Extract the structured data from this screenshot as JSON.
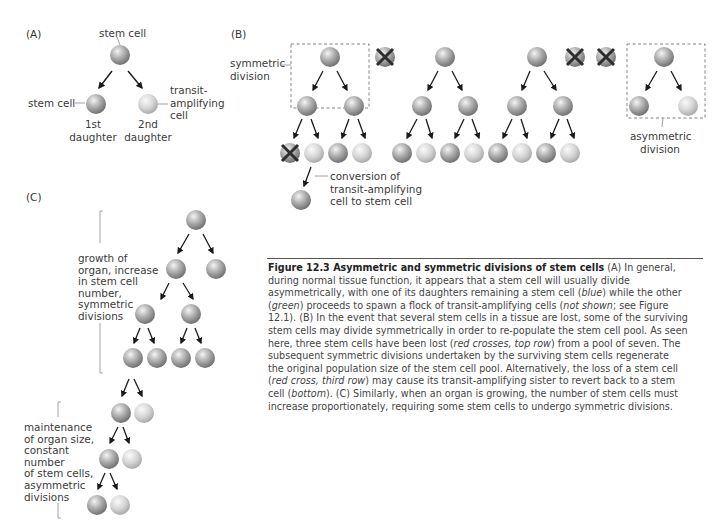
{
  "header_fragment": "g ... stem cell ... p ... g",
  "panels": {
    "A": {
      "label": "(A)",
      "top_cell_label": "stem cell",
      "left_child_label": "stem cell",
      "right_child_label_lines": [
        "transit-",
        "amplifying",
        "cell"
      ],
      "left_daughter_lines": [
        "1st",
        "daughter"
      ],
      "right_daughter_lines": [
        "2nd",
        "daughter"
      ]
    },
    "B": {
      "label": "(B)",
      "symmetric_label_lines": [
        "symmetric",
        "division"
      ],
      "asymmetric_label_lines": [
        "asymmetric",
        "division"
      ],
      "conversion_label_lines": [
        "conversion of",
        "transit-amplifying",
        "cell to stem cell"
      ]
    },
    "C": {
      "label": "(C)",
      "growth_label_lines": [
        "growth of",
        "organ, increase",
        "in stem cell",
        "number,",
        "symmetric",
        "divisions"
      ],
      "maintenance_label_lines": [
        "maintenance",
        "of organ size,",
        "constant",
        "number",
        "of stem cells,",
        "asymmetric",
        "divisions"
      ]
    }
  },
  "caption": {
    "title": "Figure 12.3 Asymmetric and symmetric divisions of stem cells",
    "lines": [
      [
        [
          "b",
          "Figure 12.3 Asymmetric and symmetric divisions of stem cells"
        ],
        [
          "t",
          " (A) In general,"
        ]
      ],
      [
        [
          "t",
          "during normal tissue function, it appears that a stem cell will usually divide"
        ]
      ],
      [
        [
          "t",
          "asymmetrically, with one of its daughters remaining a stem cell ("
        ],
        [
          "i",
          "blue"
        ],
        [
          "t",
          ") while the other"
        ]
      ],
      [
        [
          "t",
          "("
        ],
        [
          "i",
          "green"
        ],
        [
          "t",
          ") proceeds to spawn a flock of transit-amplifying cells ("
        ],
        [
          "i",
          "not shown"
        ],
        [
          "t",
          "; see Figure"
        ]
      ],
      [
        [
          "t",
          "12.1). (B) In the event that several stem cells in a tissue are lost, some of the surviving"
        ]
      ],
      [
        [
          "t",
          "stem cells may divide symmetrically in order to re-populate the stem cell pool. As seen"
        ]
      ],
      [
        [
          "t",
          "here, three stem cells have been lost ("
        ],
        [
          "i",
          "red crosses, top row"
        ],
        [
          "t",
          ") from a pool of seven. The"
        ]
      ],
      [
        [
          "t",
          "subsequent symmetric divisions undertaken by the surviving stem cells regenerate"
        ]
      ],
      [
        [
          "t",
          "the original population size of the stem cell pool. Alternatively, the loss of a stem cell"
        ]
      ],
      [
        [
          "t",
          "("
        ],
        [
          "i",
          "red cross, third row"
        ],
        [
          "t",
          ") may cause its transit-amplifying sister to revert back to a stem"
        ]
      ],
      [
        [
          "t",
          "cell ("
        ],
        [
          "i",
          "bottom"
        ],
        [
          "t",
          "). (C) Similarly, when an organ is growing, the number of stem cells must"
        ]
      ],
      [
        [
          "t",
          "increase proportionately, requiring some stem cells to undergo symmetric divisions."
        ]
      ]
    ]
  },
  "colors": {
    "stem_cell": "#8f8f8f",
    "transit_cell": "#c4c4c4",
    "cross": "#2e2e2e",
    "dashed_box": "#777777",
    "arrow": "#1a1a1a"
  }
}
